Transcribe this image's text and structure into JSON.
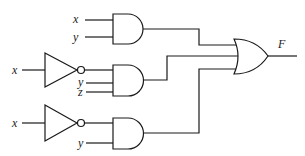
{
  "diagram": {
    "type": "logic-circuit",
    "output": {
      "label": "F"
    },
    "gates": [
      {
        "id": "and1",
        "type": "AND",
        "inputs": [
          "x",
          "y"
        ]
      },
      {
        "id": "not1",
        "type": "NOT",
        "inputs": [
          "x"
        ]
      },
      {
        "id": "and2",
        "type": "AND",
        "inputs": [
          "x'",
          "y",
          "z"
        ]
      },
      {
        "id": "not2",
        "type": "NOT",
        "inputs": [
          "x"
        ]
      },
      {
        "id": "and3",
        "type": "AND",
        "inputs": [
          "x'",
          "y"
        ]
      },
      {
        "id": "or1",
        "type": "OR",
        "inputs": [
          "and1",
          "and2",
          "and3"
        ],
        "output": "F"
      }
    ],
    "labels": {
      "and1_in1": "x",
      "and1_in2": "y",
      "not1_in": "x",
      "and2_in2": "y",
      "and2_in3": "z",
      "not2_in": "x",
      "and3_in2": "y",
      "out": "F"
    }
  }
}
